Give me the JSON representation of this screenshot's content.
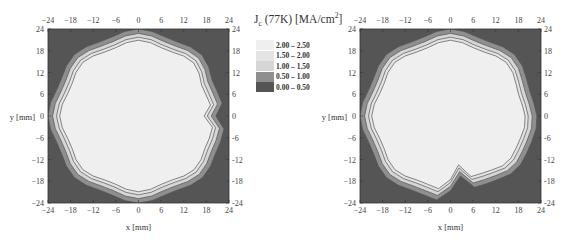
{
  "chart_data": [
    {
      "type": "heatmap",
      "subtype": "filled-contour",
      "title": "",
      "xlabel": "x [mm]",
      "ylabel": "y [mm]",
      "xlim": [
        -24,
        24
      ],
      "ylim": [
        -24,
        24
      ],
      "x_ticks": [
        -24,
        -18,
        -12,
        -6,
        0,
        6,
        12,
        18,
        24
      ],
      "y_ticks": [
        24,
        18,
        12,
        6,
        0,
        -6,
        -12,
        -18,
        -24
      ],
      "grid": false,
      "legend_position": "right",
      "description": "Left sample: nearly circular high-Jc region (2.00–2.50) with graded rim, notch at x=24,y=0"
    },
    {
      "type": "heatmap",
      "subtype": "filled-contour",
      "title": "",
      "xlabel": "x [mm]",
      "ylabel": "y [mm]",
      "xlim": [
        -24,
        24
      ],
      "ylim": [
        -24,
        24
      ],
      "x_ticks": [
        -24,
        -18,
        -12,
        -6,
        0,
        6,
        12,
        18,
        24
      ],
      "y_ticks": [
        24,
        18,
        12,
        6,
        0,
        -6,
        -12,
        -18,
        -24
      ],
      "grid": false,
      "description": "Right sample: circular high-Jc region with a crack-like defect near x=0..4, y=-16..-24"
    }
  ],
  "legend": {
    "title_main": "J",
    "title_sub": "c",
    "title_rest": " (77K) [MA/cm",
    "title_sup": "2",
    "title_end": "]",
    "entries": [
      {
        "label": "2.00 – 2.50",
        "color": "#efefef"
      },
      {
        "label": "1.50 – 2.00",
        "color": "#e4e4e4"
      },
      {
        "label": "1.00 – 1.50",
        "color": "#d6d6d6"
      },
      {
        "label": "0.50 – 1.00",
        "color": "#8f8f8f"
      },
      {
        "label": "0.00 – 0.50",
        "color": "#555555"
      }
    ]
  },
  "axes": {
    "x_tick_labels": [
      "−24",
      "−18",
      "−12",
      "−6",
      "0",
      "6",
      "12",
      "18",
      "24"
    ],
    "y_tick_labels_left": [
      "24",
      "18",
      "12",
      "6",
      "0",
      "−6",
      "−12",
      "−18",
      "−24"
    ],
    "y_tick_labels_right": [
      "24",
      "18",
      "12",
      "6",
      "0",
      "-6",
      "-12",
      "-18",
      "-24"
    ],
    "xlabel": "x [mm]",
    "ylabel": "y [mm]"
  }
}
